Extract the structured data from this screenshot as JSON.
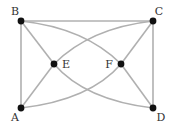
{
  "graph": {
    "nodes": [
      {
        "id": "A",
        "label": "A"
      },
      {
        "id": "B",
        "label": "B"
      },
      {
        "id": "C",
        "label": "C"
      },
      {
        "id": "D",
        "label": "D"
      },
      {
        "id": "E",
        "label": "E"
      },
      {
        "id": "F",
        "label": "F"
      }
    ],
    "edges": [
      {
        "from": "A",
        "to": "B",
        "style": "straight"
      },
      {
        "from": "B",
        "to": "C",
        "style": "straight"
      },
      {
        "from": "C",
        "to": "D",
        "style": "straight"
      },
      {
        "from": "A",
        "to": "E",
        "style": "straight"
      },
      {
        "from": "B",
        "to": "E",
        "style": "straight"
      },
      {
        "from": "C",
        "to": "F",
        "style": "straight"
      },
      {
        "from": "D",
        "to": "F",
        "style": "straight"
      },
      {
        "from": "B",
        "to": "F",
        "style": "curved"
      },
      {
        "from": "E",
        "to": "C",
        "style": "curved"
      },
      {
        "from": "A",
        "to": "F",
        "style": "curved"
      },
      {
        "from": "E",
        "to": "D",
        "style": "curved"
      }
    ]
  },
  "colors": {
    "edge": "#b0b0b0",
    "node": "#111111",
    "label": "#333333"
  }
}
